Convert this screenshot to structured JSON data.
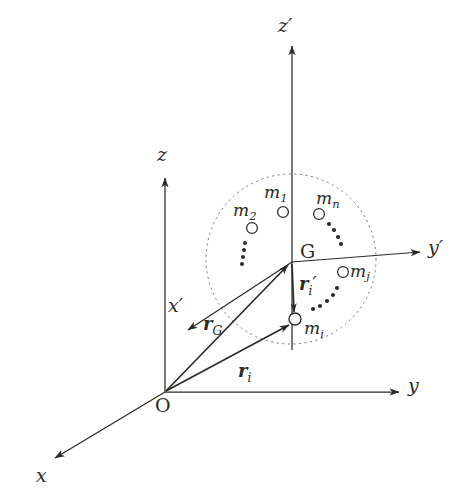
{
  "figure": {
    "background_color": "#ffffff",
    "ink_color": "#2b2b26"
  },
  "axes": {
    "global_origin_label": "O",
    "items": [
      {
        "name": "x",
        "label": "x",
        "prime": false
      },
      {
        "name": "y",
        "label": "y",
        "prime": false
      },
      {
        "name": "z",
        "label": "z",
        "prime": false
      },
      {
        "name": "x-prime",
        "label": "x",
        "prime": true
      },
      {
        "name": "y-prime",
        "label": "y",
        "prime": true
      },
      {
        "name": "z-prime",
        "label": "z",
        "prime": true
      }
    ]
  },
  "labels": {
    "origin": "O",
    "center_of_mass": "G",
    "axis_x": "x",
    "axis_y": "y",
    "axis_z": "z",
    "axis_x_prime": "x",
    "axis_y_prime": "y",
    "axis_z_prime": "z",
    "prime_mark": "′"
  },
  "masses": [
    {
      "name": "m1",
      "base": "m",
      "sub": "1"
    },
    {
      "name": "m2",
      "base": "m",
      "sub": "2"
    },
    {
      "name": "mn",
      "base": "m",
      "sub": "n"
    },
    {
      "name": "mj",
      "base": "m",
      "sub": "j"
    },
    {
      "name": "mi",
      "base": "m",
      "sub": "i"
    }
  ],
  "vectors": [
    {
      "name": "r-G",
      "base": "r",
      "sub": "G",
      "prime": false,
      "from": "O",
      "to": "G"
    },
    {
      "name": "r-i",
      "base": "r",
      "sub": "i",
      "prime": false,
      "from": "O",
      "to": "mi"
    },
    {
      "name": "r-i-prime",
      "base": "r",
      "sub": "i",
      "prime": true,
      "from": "G",
      "to": "mi"
    }
  ],
  "ellipsis_groups": [
    {
      "name": "vertical-dots-left",
      "style": "vertical"
    },
    {
      "name": "arc-dots-upper-right",
      "style": "arc"
    },
    {
      "name": "arc-dots-lower-right",
      "style": "arc"
    }
  ],
  "body_boundary": {
    "name": "rigid-body-outline",
    "shape": "dashed-circle"
  }
}
